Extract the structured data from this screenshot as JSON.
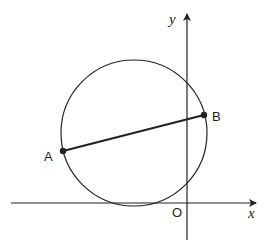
{
  "diagram": {
    "type": "coordinate-geometry",
    "axes": {
      "x_label": "x",
      "y_label": "y",
      "origin_label": "O"
    },
    "circle": {
      "description": "circle touching the x-axis, to the left of the y-axis origin, crossing the y-axis"
    },
    "chord": {
      "description": "line segment AB joining two points on the circle",
      "endpoints": [
        {
          "label": "A"
        },
        {
          "label": "B"
        }
      ]
    }
  },
  "colors": {
    "stroke": "#222222",
    "background": "#ffffff"
  }
}
